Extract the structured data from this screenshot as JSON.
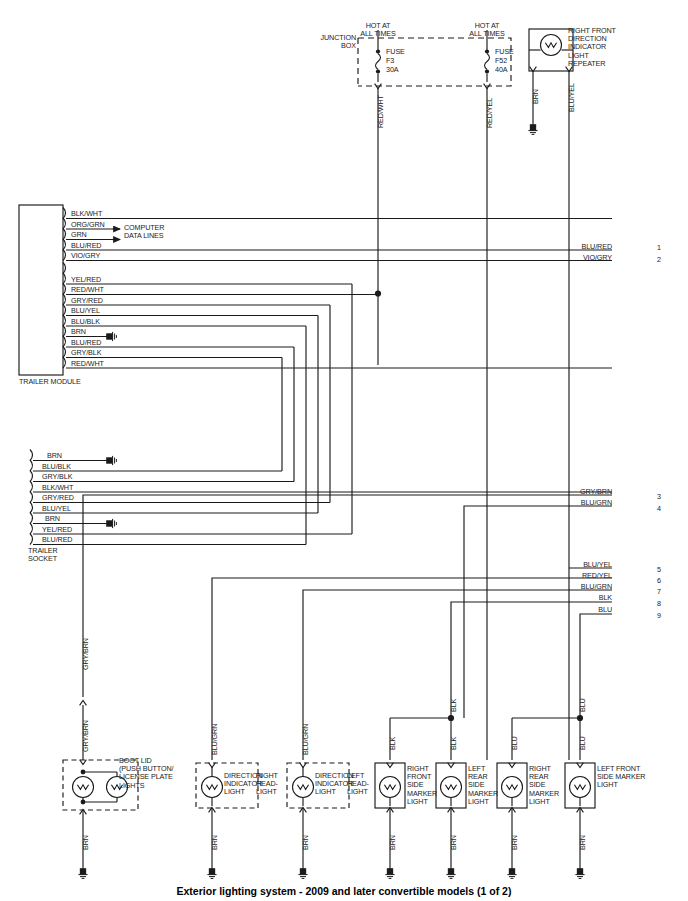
{
  "diagram": {
    "caption": "Exterior lighting system - 2009 and later convertible models (1 of 2)",
    "title_top_left": "JUNCTION\nBOX"
  },
  "fuses": {
    "hot_label": "HOT AT\nALL TIMES",
    "items": [
      {
        "label": "FUSE",
        "id": "F3",
        "rating": "30A",
        "wire": "RED/WHT"
      },
      {
        "label": "FUSE",
        "id": "F52",
        "rating": "40A",
        "wire": "RED/YEL"
      }
    ]
  },
  "top_lamp": {
    "name": "RIGHT FRONT\nDIRECTION\nINDICATOR\nLIGHT\nREPEATER",
    "left_wire": "BRN",
    "right_wire": "BLU/YEL"
  },
  "trailer_module": {
    "name": "TRAILER MODULE",
    "note": "COMPUTER\nDATA LINES",
    "pins": [
      "BLK/WHT",
      "ORG/GRN",
      "GRN",
      "BLU/RED",
      "VIO/GRY",
      "YEL/RED",
      "RED/WHT",
      "GRY/RED",
      "BLU/YEL",
      "BLU/BLK",
      "BRN",
      "BLU/RED",
      "GRY/BLK",
      "RED/WHT"
    ]
  },
  "trailer_socket": {
    "name": "TRAILER\nSOCKET",
    "pins": [
      "BRN",
      "BLU/BLK",
      "GRY/BLK",
      "BLK/WHT",
      "GRY/RED",
      "BLU/YEL",
      "BRN",
      "YEL/RED",
      "BLU/RED"
    ]
  },
  "right_connector": {
    "rows": [
      {
        "wire": "BLU/RED",
        "num": "1"
      },
      {
        "wire": "VIO/GRY",
        "num": "2"
      },
      {
        "wire": "GRY/BRN",
        "num": "3"
      },
      {
        "wire": "BLU/GRN",
        "num": "4"
      },
      {
        "wire": "BLU/YEL",
        "num": "5"
      },
      {
        "wire": "RED/YEL",
        "num": "6"
      },
      {
        "wire": "BLU/GRN",
        "num": "7"
      },
      {
        "wire": "BLK",
        "num": "8"
      },
      {
        "wire": "BLU",
        "num": "9"
      }
    ]
  },
  "bottom_lamps": [
    {
      "name": "BOOT LID\n(PUSH BUTTON/\nLICENSE PLATE\nLIGHTS",
      "top_wire": "GRY/BRN",
      "top_wire2": "GRY/BRN",
      "bottom_wire": "BRN",
      "dashed": true,
      "double": true
    },
    {
      "name": "DIRECTION\nINDICATOR\nLIGHT",
      "name2": "RIGHT\nHEAD-\nLIGHT",
      "top_wire": "BLU/GRN",
      "bottom_wire": "BRN",
      "dashed": true,
      "double": false
    },
    {
      "name": "DIRECTION\nINDICATOR\nLIGHT",
      "name2": "LEFT\nHEAD-\nLIGHT",
      "top_wire": "BLU/GRN",
      "bottom_wire": "BRN",
      "dashed": true,
      "double": false
    },
    {
      "name": "RIGHT\nFRONT\nSIDE\nMARKER\nLIGHT",
      "top_wire": "BLK",
      "bottom_wire": "BRN",
      "dashed": false,
      "double": false
    },
    {
      "name": "LEFT\nREAR\nSIDE\nMARKER\nLIGHT",
      "top_wire": "BLK",
      "bottom_wire": "BRN",
      "dashed": false,
      "double": false
    },
    {
      "name": "RIGHT\nREAR\nSIDE\nMARKER\nLIGHT",
      "top_wire": "BLU",
      "bottom_wire": "BRN",
      "dashed": false,
      "double": false
    },
    {
      "name": "LEFT FRONT\nSIDE MARKER\nLIGHT",
      "top_wire": "BLU",
      "bottom_wire": "BRN",
      "dashed": false,
      "double": false
    }
  ],
  "branch_wire_labels": {
    "blk_upper": "BLK",
    "blk_left": "BLK",
    "blk_right": "BLK",
    "blu_upper": "BLU",
    "blu_left": "BLU",
    "blu_right": "BLU"
  },
  "colors": {
    "line": "#1b1b1b",
    "text": "#1b1b1b",
    "background": "#ffffff"
  }
}
